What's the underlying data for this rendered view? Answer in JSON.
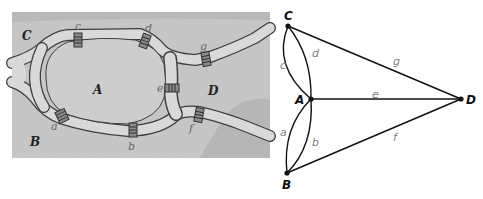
{
  "map": {
    "regions": [
      {
        "id": "C",
        "label": "C",
        "x": 22,
        "y": 40
      },
      {
        "id": "A",
        "label": "A",
        "x": 93,
        "y": 94
      },
      {
        "id": "B",
        "label": "B",
        "x": 30,
        "y": 146
      },
      {
        "id": "D",
        "label": "D",
        "x": 208,
        "y": 95
      }
    ],
    "bridges": [
      {
        "id": "a",
        "label": "a",
        "x": 51,
        "y": 130
      },
      {
        "id": "b",
        "label": "b",
        "x": 128,
        "y": 150
      },
      {
        "id": "c",
        "label": "c",
        "x": 75,
        "y": 30
      },
      {
        "id": "d",
        "label": "d",
        "x": 145,
        "y": 32
      },
      {
        "id": "e",
        "label": "e",
        "x": 157,
        "y": 92
      },
      {
        "id": "f",
        "label": "f",
        "x": 189,
        "y": 132
      },
      {
        "id": "g",
        "label": "g",
        "x": 200,
        "y": 50
      }
    ],
    "colors": {
      "land": "#c9c9c9",
      "land_dark": "#9a9a9a",
      "river": "#dcdcdc",
      "river_edge": "#4a4a4a"
    }
  },
  "graph": {
    "nodes": [
      {
        "id": "C",
        "label": "C",
        "x": 288,
        "y": 26,
        "lx": 284,
        "ly": 20
      },
      {
        "id": "A",
        "label": "A",
        "x": 311,
        "y": 99,
        "lx": 295,
        "ly": 104
      },
      {
        "id": "B",
        "label": "B",
        "x": 287,
        "y": 173,
        "lx": 282,
        "ly": 189
      },
      {
        "id": "D",
        "label": "D",
        "x": 461,
        "y": 99,
        "lx": 466,
        "ly": 104
      }
    ],
    "edges": [
      {
        "id": "a",
        "label": "a",
        "from": "A",
        "to": "B",
        "lx": 280,
        "ly": 136
      },
      {
        "id": "b",
        "label": "b",
        "from": "A",
        "to": "B",
        "lx": 312,
        "ly": 146
      },
      {
        "id": "c",
        "label": "c",
        "from": "C",
        "to": "A",
        "lx": 280,
        "ly": 69
      },
      {
        "id": "d",
        "label": "d",
        "from": "C",
        "to": "A",
        "lx": 312,
        "ly": 57
      },
      {
        "id": "e",
        "label": "e",
        "from": "A",
        "to": "D",
        "lx": 372,
        "ly": 98
      },
      {
        "id": "f",
        "label": "f",
        "from": "B",
        "to": "D",
        "lx": 393,
        "ly": 141
      },
      {
        "id": "g",
        "label": "g",
        "from": "C",
        "to": "D",
        "lx": 393,
        "ly": 65
      }
    ],
    "colors": {
      "edge": "#111111",
      "node": "#111111",
      "edge_label": "#808080"
    }
  }
}
